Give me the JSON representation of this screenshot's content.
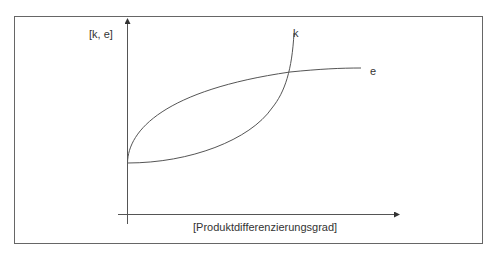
{
  "diagram": {
    "y_axis_label": "[k, e]",
    "x_axis_label": "[Produktdifferenzierungsgrad]",
    "curves": [
      {
        "name": "k",
        "label": "k",
        "shape": "convex, rising steeply"
      },
      {
        "name": "e",
        "label": "e",
        "shape": "concave, saturating"
      }
    ],
    "colors": {
      "line": "#555555",
      "frame": "#666666",
      "text": "#333333"
    }
  }
}
